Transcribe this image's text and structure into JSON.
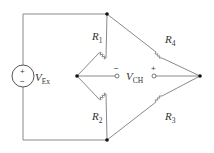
{
  "diagram": {
    "source": {
      "symbol": "V",
      "subscript": "Ex",
      "plus": "+",
      "minus": "−"
    },
    "output": {
      "symbol": "V",
      "subscript": "CH",
      "plus": "+",
      "minus": "−"
    },
    "resistors": [
      {
        "symbol": "R",
        "subscript": "1",
        "position": "upper-left"
      },
      {
        "symbol": "R",
        "subscript": "2",
        "position": "lower-left"
      },
      {
        "symbol": "R",
        "subscript": "3",
        "position": "lower-right"
      },
      {
        "symbol": "R",
        "subscript": "4",
        "position": "upper-right"
      }
    ],
    "colors": {
      "wire": "#888888",
      "text": "#333333",
      "node": "#111111"
    }
  }
}
